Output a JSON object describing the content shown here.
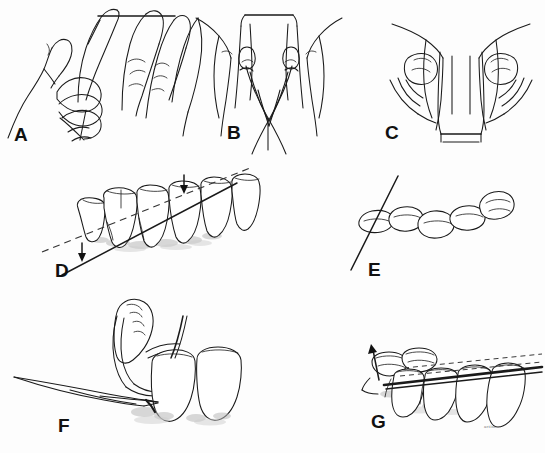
{
  "figure": {
    "background_color": "#fdfdfd",
    "ink_color": "#1a1a1a",
    "width": 545,
    "height": 453,
    "signature": "artist"
  },
  "panels": [
    {
      "id": "A",
      "letter": "A",
      "letter_x": 14,
      "letter_y": 141,
      "caption": "Two hands holding a length of floss stretched between index fingers, side view",
      "subject": "hands-holding-floss-side-view"
    },
    {
      "id": "B",
      "letter": "B",
      "letter_x": 227,
      "letter_y": 139,
      "caption": "Floss wrapped around both index fingers, frontal view with floss crossing below",
      "subject": "floss-wrapped-index-fingers"
    },
    {
      "id": "C",
      "letter": "C",
      "letter_x": 385,
      "letter_y": 139,
      "caption": "Thumbs and index fingers guiding the floss, frontal view",
      "subject": "thumb-index-floss-guide"
    },
    {
      "id": "D",
      "letter": "D",
      "letter_x": 55,
      "letter_y": 277,
      "caption": "Lateral view of teeth, floss passed interproximally with up and down direction arrows",
      "subject": "teeth-lateral-floss-interproximal"
    },
    {
      "id": "E",
      "letter": "E",
      "letter_x": 368,
      "letter_y": 276,
      "caption": "Occlusal view of a tooth arch with floss seated in the contact area",
      "subject": "teeth-occlusal-floss-contact"
    },
    {
      "id": "F",
      "letter": "F",
      "letter_x": 58,
      "letter_y": 432,
      "caption": "Close-up of floss and instrument at the gingival sulcus adjacent to two teeth",
      "subject": "floss-gingival-sulcus-closeup"
    },
    {
      "id": "G",
      "letter": "G",
      "letter_x": 371,
      "letter_y": 428,
      "caption": "Floss drawn along the tooth surface toward the occlusal plane, arrow showing withdrawal direction",
      "subject": "floss-withdrawal-direction"
    }
  ],
  "annotations": {
    "arrows": [
      {
        "panel": "D",
        "name": "down-arrow-left",
        "direction": "down"
      },
      {
        "panel": "D",
        "name": "down-arrow-right",
        "direction": "down"
      },
      {
        "panel": "G",
        "name": "up-arrow",
        "direction": "up-left"
      }
    ],
    "reference_lines": [
      {
        "panel": "D",
        "name": "dashed-reference-line",
        "style": "dashed"
      },
      {
        "panel": "D",
        "name": "solid-floss-line",
        "style": "solid"
      },
      {
        "panel": "E",
        "name": "solid-floss-line",
        "style": "solid"
      },
      {
        "panel": "G",
        "name": "dashed-reference-line-upper",
        "style": "dashed"
      },
      {
        "panel": "G",
        "name": "dashed-reference-line-lower",
        "style": "dashed"
      },
      {
        "panel": "G",
        "name": "solid-floss-line",
        "style": "solid"
      }
    ]
  }
}
